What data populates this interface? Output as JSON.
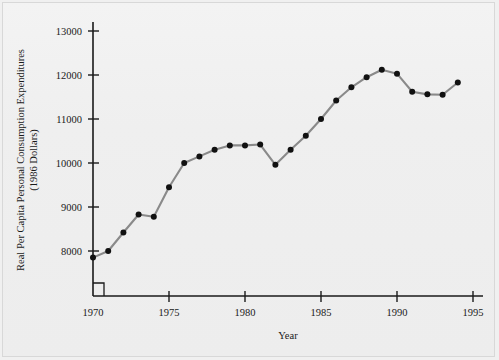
{
  "chart_data": {
    "type": "line",
    "title": "",
    "xlabel": "Year",
    "ylabel": "Real Per Capita Personal Consumption Expenditures",
    "ylabel_line2": "(1986 Dollars)",
    "x": [
      1970,
      1971,
      1972,
      1973,
      1974,
      1975,
      1976,
      1977,
      1978,
      1979,
      1980,
      1981,
      1982,
      1983,
      1984,
      1985,
      1986,
      1987,
      1988,
      1989,
      1990,
      1991,
      1992,
      1993,
      1994
    ],
    "values": [
      7850,
      8000,
      8420,
      8830,
      8780,
      9450,
      10000,
      10150,
      10300,
      10400,
      10400,
      10420,
      9960,
      10300,
      10620,
      11000,
      11420,
      11720,
      11950,
      12120,
      12030,
      11620,
      11560,
      11550,
      11830
    ],
    "series": [
      {
        "name": "Real Per Capita Personal Consumption Expenditures",
        "values": [
          7850,
          8000,
          8420,
          8830,
          8780,
          9450,
          10000,
          10150,
          10300,
          10400,
          10400,
          10420,
          9960,
          10300,
          10620,
          11000,
          11420,
          11720,
          11950,
          12120,
          12030,
          11620,
          11560,
          11550,
          11830
        ]
      }
    ],
    "xlim": [
      1970,
      1995
    ],
    "ylim": [
      7600,
      13000
    ],
    "ytick_labels": [
      "8000",
      "9000",
      "10000",
      "11000",
      "12000",
      "13000"
    ],
    "ytick_values": [
      8000,
      9000,
      10000,
      11000,
      12000,
      13000
    ],
    "xtick_labels": [
      "1970",
      "1975",
      "1980",
      "1985",
      "1990",
      "1995"
    ],
    "xtick_values": [
      1970,
      1975,
      1980,
      1985,
      1990,
      1995
    ],
    "grid": false,
    "legend": "none",
    "axis_break_x": true,
    "axis_break_y": true,
    "line_color": "#8a8a8a",
    "marker_color": "#111111",
    "axis_color": "#1a1a1a",
    "background_color": "#efefef"
  }
}
